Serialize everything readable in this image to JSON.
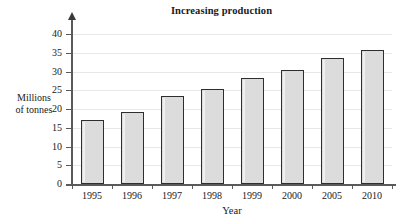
{
  "chart_data": {
    "type": "bar",
    "title": "Increasing production",
    "xlabel": "Year",
    "ylabel_line1": "Millions",
    "ylabel_line2": "of tonnes",
    "categories": [
      "1995",
      "1996",
      "1997",
      "1998",
      "1999",
      "2000",
      "2005",
      "2010"
    ],
    "values": [
      17,
      19.2,
      23.4,
      25.3,
      28.3,
      30.5,
      33.6,
      35.7
    ],
    "ylim": [
      0,
      40
    ],
    "ytick_labels": [
      "0",
      "5",
      "10",
      "15",
      "20",
      "25",
      "30",
      "35",
      "40"
    ],
    "ytick_values": [
      0,
      5,
      10,
      15,
      20,
      25,
      30,
      35,
      40
    ],
    "grid": true,
    "legend": "none",
    "bar_fill_color": "#dcdcdc",
    "bar_border_color": "#2e2e2e",
    "axis_color": "#5a5a5a",
    "grid_color": "#e8e8e8"
  }
}
